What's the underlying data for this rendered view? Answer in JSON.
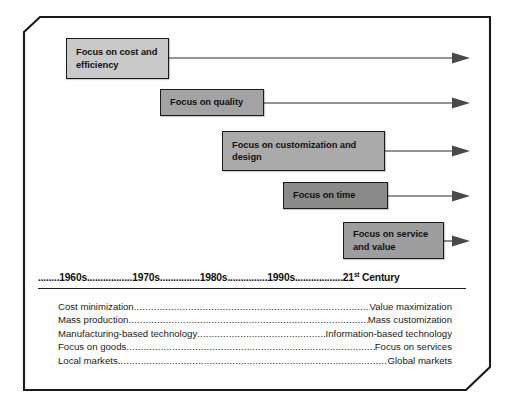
{
  "figure": {
    "frame": {
      "border_color": "#1a1a1a",
      "background_color": "#ffffff",
      "bevel_corners": [
        "top-left",
        "bottom-right"
      ]
    }
  },
  "timeline_boxes": [
    {
      "id": "cost-efficiency",
      "label": "Focus on cost and efficiency",
      "lines": [
        "Focus on cost and",
        "efficiency"
      ],
      "fill_color": "#c9c9c9",
      "x": 66,
      "y": 38,
      "width": 103,
      "height": 41,
      "arrow_y": 58
    },
    {
      "id": "quality",
      "label": "Focus on quality",
      "lines": [
        "Focus on quality"
      ],
      "fill_color": "#a3a3a3",
      "x": 160,
      "y": 89,
      "width": 104,
      "height": 27,
      "arrow_y": 103
    },
    {
      "id": "customization-design",
      "label": "Focus on customization and design",
      "lines": [
        "Focus on customization and",
        "design"
      ],
      "fill_color": "#aaaaaa",
      "x": 222,
      "y": 131,
      "width": 163,
      "height": 40,
      "arrow_y": 151
    },
    {
      "id": "time",
      "label": "Focus on time",
      "lines": [
        "Focus on time"
      ],
      "fill_color": "#8a8a8a",
      "x": 283,
      "y": 182,
      "width": 105,
      "height": 27,
      "arrow_y": 196
    },
    {
      "id": "service-value",
      "label": "Focus on service and value",
      "lines": [
        "Focus on service",
        "and value"
      ],
      "fill_color": "#9e9e9e",
      "x": 343,
      "y": 222,
      "width": 101,
      "height": 37,
      "arrow_y": 241
    }
  ],
  "arrows": {
    "end_x": 470,
    "line_color": "#2a2a2a",
    "head_color": "#4a4a4a"
  },
  "decade_axis": {
    "leading_dots": "........",
    "segments": [
      {
        "label": "1960s",
        "trailing_dots": "................."
      },
      {
        "label": "1970s",
        "trailing_dots": "..............."
      },
      {
        "label": "1980s",
        "trailing_dots": "..............."
      },
      {
        "label": "1990s",
        "trailing_dots": ".................."
      }
    ],
    "final_label_number": "21",
    "final_label_ordinal": "st",
    "final_label_rest": " Century",
    "full_text": "........1960s.................1970s...............1980s...............1990s..................21st Century"
  },
  "contrasts": [
    {
      "left": "Cost minimization",
      "right": "Value maximization"
    },
    {
      "left": "Mass production",
      "right": "Mass customization"
    },
    {
      "left": "Manufacturing-based technology",
      "right": "Information-based technology"
    },
    {
      "left": "Focus on goods",
      "right": "Focus on services"
    },
    {
      "left": "Local markets",
      "right": "Global markets"
    }
  ]
}
